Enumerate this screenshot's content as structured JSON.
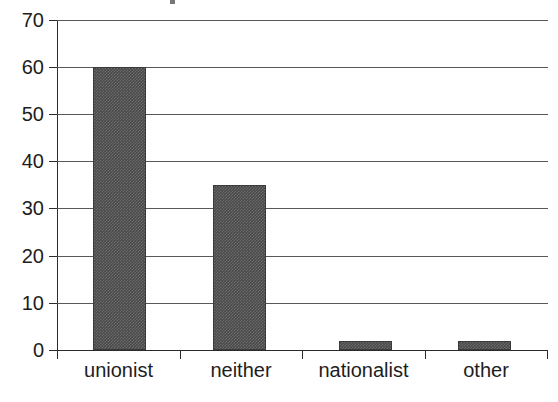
{
  "chart_data": {
    "type": "bar",
    "title": "",
    "xlabel": "",
    "ylabel": "",
    "categories": [
      "unionist",
      "neither",
      "nationalist",
      "other"
    ],
    "values": [
      60,
      35,
      2,
      2
    ],
    "ylim": [
      0,
      70
    ],
    "yticks": [
      0,
      10,
      20,
      30,
      40,
      50,
      60,
      70
    ],
    "ytick_labels": [
      "0",
      "10",
      "20",
      "30",
      "40",
      "50",
      "60",
      "70"
    ],
    "grid": "horizontal",
    "legend": "none",
    "series": [
      {
        "name": "",
        "values": [
          60,
          35,
          2,
          2
        ]
      }
    ],
    "colors": {
      "bar_fill": "#4a4a4a",
      "bar_edge": "#3a3a3a",
      "gridline": "#58585a",
      "axis": "#2b2b2b",
      "background": "#ffffff",
      "text": "#1d1d1d"
    }
  }
}
